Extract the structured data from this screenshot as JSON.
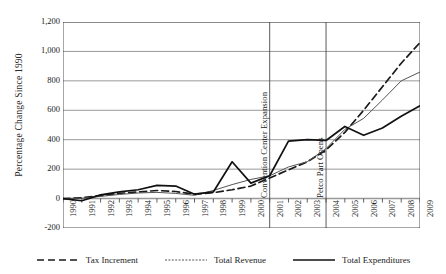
{
  "chart_data": {
    "type": "line",
    "title": "",
    "xlabel": "",
    "ylabel": "Percentage Change Since 1990",
    "x": [
      1990,
      1991,
      1992,
      1993,
      1994,
      1995,
      1996,
      1997,
      1998,
      1999,
      2000,
      2001,
      2002,
      2003,
      2004,
      2005,
      2006,
      2007,
      2008,
      2009
    ],
    "xtick_labels": [
      "1990",
      "1991",
      "1992",
      "1993",
      "1994",
      "1995",
      "1996",
      "1997",
      "1998",
      "1999",
      "2000",
      "2001",
      "2002",
      "2003",
      "2004",
      "2005",
      "2006",
      "2007",
      "2008",
      "2009"
    ],
    "ytick_labels": [
      "1,200",
      "1,000",
      "800",
      "600",
      "400",
      "200",
      "0",
      "-200"
    ],
    "ytick_values": [
      1200,
      1000,
      800,
      600,
      400,
      200,
      0,
      -200
    ],
    "ylim": [
      -200,
      1200
    ],
    "grid": "horizontal",
    "legend_position": "bottom",
    "series": [
      {
        "name": "Tax Increment",
        "style": "dashed",
        "color": "#1a1a1a",
        "values": [
          0,
          5,
          20,
          35,
          45,
          55,
          48,
          30,
          40,
          60,
          85,
          140,
          195,
          250,
          330,
          450,
          600,
          760,
          920,
          1060
        ]
      },
      {
        "name": "Total Revenue",
        "style": "thin",
        "color": "#555555",
        "values": [
          0,
          2,
          15,
          28,
          38,
          42,
          35,
          22,
          55,
          95,
          130,
          155,
          215,
          250,
          340,
          470,
          545,
          670,
          800,
          860
        ]
      },
      {
        "name": "Total Expenditures",
        "style": "solid",
        "color": "#111111",
        "values": [
          0,
          -15,
          25,
          45,
          60,
          90,
          85,
          30,
          45,
          250,
          105,
          155,
          390,
          400,
          395,
          490,
          430,
          480,
          560,
          630
        ]
      }
    ],
    "annotations": [
      {
        "label": "Convention Center Expansion",
        "x": 2001
      },
      {
        "label": "Petco Part Opens",
        "x": 2004
      }
    ]
  }
}
